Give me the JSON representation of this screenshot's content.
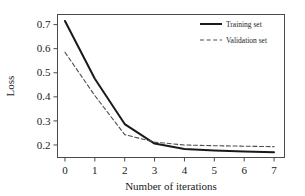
{
  "chart_data": {
    "type": "line",
    "title": "",
    "xlabel": "Number of iterations",
    "ylabel": "Loss",
    "x": [
      0,
      1,
      2,
      3,
      4,
      5,
      6,
      7
    ],
    "xlim": [
      -0.25,
      7.35
    ],
    "ylim": [
      0.148,
      0.742
    ],
    "xticks": [
      0,
      1,
      2,
      3,
      4,
      5,
      6,
      7
    ],
    "xtick_labels": [
      "0",
      "1",
      "2",
      "3",
      "4",
      "5",
      "6",
      "7"
    ],
    "yticks": [
      0.2,
      0.3,
      0.4,
      0.5,
      0.6,
      0.7
    ],
    "ytick_labels": [
      "0.2",
      "0.3",
      "0.4",
      "0.5",
      "0.6",
      "0.7"
    ],
    "grid": false,
    "frame": true,
    "legend_position": "top-right",
    "series": [
      {
        "name": "Training set",
        "style": "solid",
        "color": "#1a1a1a",
        "values": [
          0.715,
          0.475,
          0.287,
          0.206,
          0.183,
          0.177,
          0.173,
          0.17
        ]
      },
      {
        "name": "Validation set",
        "style": "dashed",
        "color": "#4d4d4d",
        "values": [
          0.585,
          0.405,
          0.243,
          0.212,
          0.2,
          0.197,
          0.195,
          0.193
        ]
      }
    ]
  },
  "axes": {
    "x_title": "Number of iterations",
    "y_title": "Loss"
  },
  "legend": {
    "entries": [
      {
        "label": "Training set"
      },
      {
        "label": "Validation set"
      }
    ]
  },
  "ticks": {
    "x": [
      "0",
      "1",
      "2",
      "3",
      "4",
      "5",
      "6",
      "7"
    ],
    "y": [
      "0.7",
      "0.6",
      "0.5",
      "0.4",
      "0.3",
      "0.2"
    ]
  }
}
